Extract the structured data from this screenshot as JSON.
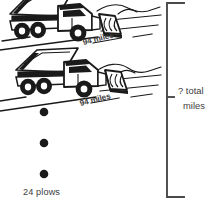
{
  "diagram": {
    "type": "word-problem-illustration",
    "background_color": "#ffffff",
    "ink_color": "#1a1a1a",
    "text_color": "#3d3d3d"
  },
  "vehicles": [
    {
      "name": "snow-plow-truck-1",
      "distance_label": "94 miles"
    },
    {
      "name": "snow-plow-truck-2",
      "distance_label": "94 miles"
    }
  ],
  "continuation": {
    "name": "vertical-ellipsis",
    "dot_count": 3,
    "meaning": "more plows continue"
  },
  "captions": {
    "plow_count": "24 plows",
    "total_line1": "? total",
    "total_line2": "miles"
  },
  "bracket": {
    "name": "right-brace",
    "orientation": "right",
    "spans": "all plows"
  }
}
